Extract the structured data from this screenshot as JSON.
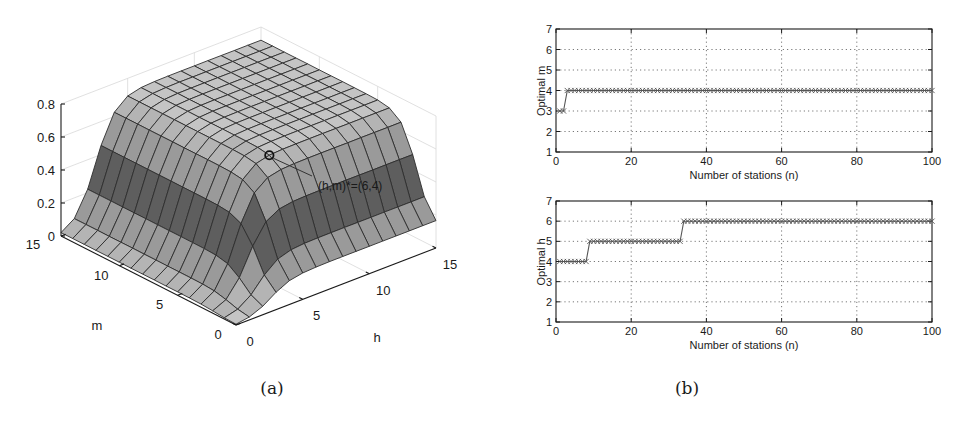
{
  "chart_data": [
    {
      "panel": "a",
      "type": "surface3d",
      "caption": "(a)",
      "xlabel": "h",
      "ylabel": "m",
      "zlabel": "",
      "xlim": [
        0,
        15
      ],
      "ylim": [
        0,
        15
      ],
      "zlim": [
        0,
        0.8
      ],
      "xticks": [
        "0",
        "5",
        "10",
        "15"
      ],
      "yticks": [
        "0",
        "5",
        "10",
        "15"
      ],
      "zticks": [
        "0",
        "0.2",
        "0.4",
        "0.6",
        "0.8"
      ],
      "grid": true,
      "annotation": {
        "text": "(h,m)*=(6,4)",
        "h": 6,
        "m": 4,
        "marker": "circle"
      },
      "description": "Surface rising steeply from near 0 at low h and low m to a plateau of about 0.68-0.72 for h >= 6 and m >= 4; optimum marked at (h,m)=(6,4)."
    },
    {
      "panel": "b-top",
      "type": "line",
      "caption": "(b)",
      "xlabel": "Number of stations (n)",
      "ylabel": "Optimal m",
      "xlim": [
        0,
        100
      ],
      "ylim": [
        1,
        7
      ],
      "xticks": [
        "0",
        "20",
        "40",
        "60",
        "80",
        "100"
      ],
      "yticks": [
        "1",
        "2",
        "3",
        "4",
        "5",
        "6",
        "7"
      ],
      "grid": true,
      "marker": "x",
      "series": [
        {
          "name": "Optimal m",
          "segments": [
            {
              "n_from": 1,
              "n_to": 2,
              "value": 3
            },
            {
              "n_from": 3,
              "n_to": 100,
              "value": 4
            }
          ]
        }
      ]
    },
    {
      "panel": "b-bottom",
      "type": "line",
      "caption": "(b)",
      "xlabel": "Number of stations (n)",
      "ylabel": "Optimal h",
      "xlim": [
        0,
        100
      ],
      "ylim": [
        1,
        7
      ],
      "xticks": [
        "0",
        "20",
        "40",
        "60",
        "80",
        "100"
      ],
      "yticks": [
        "1",
        "2",
        "3",
        "4",
        "5",
        "6",
        "7"
      ],
      "grid": true,
      "marker": "x",
      "series": [
        {
          "name": "Optimal h",
          "segments": [
            {
              "n_from": 1,
              "n_to": 8,
              "value": 4
            },
            {
              "n_from": 9,
              "n_to": 33,
              "value": 5
            },
            {
              "n_from": 34,
              "n_to": 100,
              "value": 6
            }
          ]
        }
      ]
    }
  ],
  "colors": {
    "axis": "#1a1a1a",
    "grid": "#555555",
    "surface_top": "#c4c4c4",
    "surface_mid": "#9a9a9a",
    "surface_dark": "#5e5e5e",
    "series": "#555555"
  }
}
